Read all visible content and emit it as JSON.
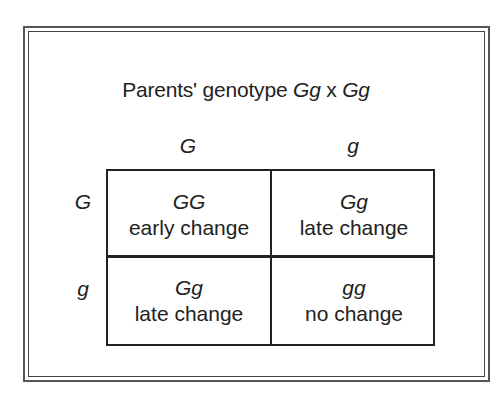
{
  "diagram": {
    "type": "punnett-square",
    "title": {
      "prefix": "Parents' genotype ",
      "parent1": "Gg",
      "cross": " x ",
      "parent2": "Gg"
    },
    "column_alleles": [
      "G",
      "g"
    ],
    "row_alleles": [
      "G",
      "g"
    ],
    "cells": [
      [
        {
          "genotype": "GG",
          "phenotype": "early change"
        },
        {
          "genotype": "Gg",
          "phenotype": "late change"
        }
      ],
      [
        {
          "genotype": "Gg",
          "phenotype": "late change"
        },
        {
          "genotype": "gg",
          "phenotype": "no change"
        }
      ]
    ]
  }
}
